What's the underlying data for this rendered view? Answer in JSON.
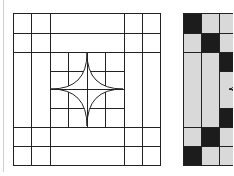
{
  "figure": {
    "colors": {
      "background": "#ffffff",
      "line": "#222222",
      "dark_fill": "#1c1c1c",
      "light_fill": "#d9d9d9",
      "left_rule": "#d0d0d0"
    },
    "panels": [
      {
        "name": "outline-block",
        "style": "line-drawing",
        "outer": {
          "x": 13,
          "y": 13,
          "w": 147,
          "h": 152
        },
        "vertical_lines": [
          31,
          50,
          124,
          142
        ],
        "horizontal_lines": [
          33,
          52,
          127,
          146
        ],
        "inner_grid": {
          "x": 50,
          "y": 52,
          "w": 74,
          "h": 75,
          "vertical": [
            68,
            87,
            105
          ],
          "horizontal": [
            71,
            89,
            108
          ]
        },
        "star": {
          "top": [
            87,
            53
          ],
          "right": [
            123,
            89
          ],
          "bottom": [
            87,
            126
          ],
          "left": [
            51,
            89
          ]
        }
      },
      {
        "name": "shaded-block",
        "style": "filled",
        "origin": {
          "x": 183,
          "y": 13
        },
        "visible_cells": [
          {
            "x": 183,
            "y": 13,
            "w": 18,
            "h": 20,
            "fill": "dark"
          },
          {
            "x": 201,
            "y": 13,
            "w": 18,
            "h": 20,
            "fill": "light"
          },
          {
            "x": 219,
            "y": 13,
            "w": 14,
            "h": 20,
            "fill": "light"
          },
          {
            "x": 183,
            "y": 33,
            "w": 18,
            "h": 19,
            "fill": "light"
          },
          {
            "x": 201,
            "y": 33,
            "w": 18,
            "h": 19,
            "fill": "dark"
          },
          {
            "x": 219,
            "y": 33,
            "w": 14,
            "h": 19,
            "fill": "light"
          },
          {
            "x": 183,
            "y": 52,
            "w": 18,
            "h": 75,
            "fill": "light"
          },
          {
            "x": 201,
            "y": 52,
            "w": 18,
            "h": 75,
            "fill": "light"
          },
          {
            "x": 219,
            "y": 52,
            "w": 14,
            "h": 19,
            "fill": "dark"
          },
          {
            "x": 219,
            "y": 71,
            "w": 14,
            "h": 37,
            "fill": "light"
          },
          {
            "x": 219,
            "y": 108,
            "w": 14,
            "h": 19,
            "fill": "dark"
          },
          {
            "x": 183,
            "y": 127,
            "w": 18,
            "h": 19,
            "fill": "light"
          },
          {
            "x": 201,
            "y": 127,
            "w": 18,
            "h": 19,
            "fill": "dark"
          },
          {
            "x": 219,
            "y": 127,
            "w": 14,
            "h": 19,
            "fill": "light"
          },
          {
            "x": 183,
            "y": 146,
            "w": 18,
            "h": 19,
            "fill": "dark"
          },
          {
            "x": 201,
            "y": 146,
            "w": 18,
            "h": 19,
            "fill": "light"
          },
          {
            "x": 219,
            "y": 146,
            "w": 14,
            "h": 19,
            "fill": "light"
          }
        ],
        "star_tip": [
          229,
          89
        ]
      }
    ]
  }
}
